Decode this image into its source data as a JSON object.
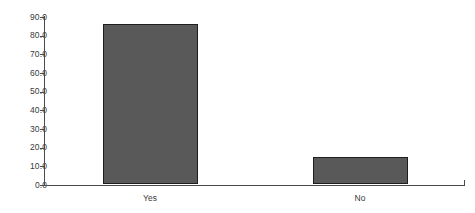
{
  "chart_data": {
    "type": "bar",
    "title": "",
    "subtitle": "",
    "xlabel": "",
    "ylabel": "",
    "categories": [
      "Yes",
      "No"
    ],
    "values": [
      85.5,
      14.5
    ],
    "series": [
      {
        "name": "",
        "values": [
          85.5,
          14.5
        ]
      }
    ],
    "ylim": [
      0.0,
      90.0
    ],
    "ytick_step": 10.0,
    "ytick_labels": [
      "0.0",
      "10.0",
      "20.0",
      "30.0",
      "40.0",
      "50.0",
      "60.0",
      "70.0",
      "80.0",
      "90.0"
    ],
    "ytick_values": [
      0,
      10,
      20,
      30,
      40,
      50,
      60,
      70,
      80,
      90
    ],
    "grid": false,
    "legend": false,
    "legend_position": "none",
    "bar_fill_color": "#595959",
    "bar_border_color": "#1e1e1e",
    "axis_color": "#4a4a4a",
    "text_color": "#3a3a3a",
    "background_color": "#ffffff",
    "annotations": []
  }
}
